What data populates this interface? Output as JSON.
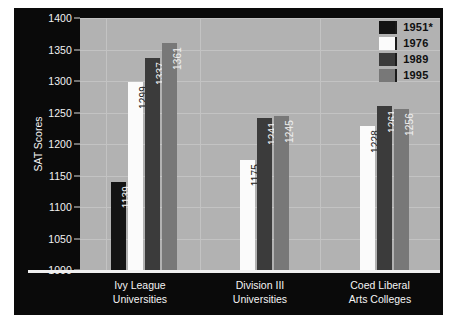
{
  "chart_data": {
    "type": "bar",
    "title": "",
    "xlabel": "",
    "ylabel": "SAT Scores",
    "ylim": [
      1000,
      1400
    ],
    "ytick_step": 50,
    "yticks": [
      1000,
      1050,
      1100,
      1150,
      1200,
      1250,
      1300,
      1350,
      1400
    ],
    "grid": true,
    "legend_position": "top-right",
    "categories": [
      "Ivy League Universities",
      "Division III Universities",
      "Coed Liberal Arts Colleges"
    ],
    "category_lines": [
      [
        "Ivy League",
        "Universities"
      ],
      [
        "Division III",
        "Universities"
      ],
      [
        "Coed Liberal",
        "Arts Colleges"
      ]
    ],
    "series": [
      {
        "name": "1951*",
        "color": "#141414",
        "label_color": "#f5f5f5",
        "values": [
          1139,
          null,
          null
        ]
      },
      {
        "name": "1976",
        "color": "#fbfbfb",
        "label_color": "#1a1a1a",
        "values": [
          1299,
          1175,
          1228
        ]
      },
      {
        "name": "1989",
        "color": "#3b3b3b",
        "label_color": "#f5f5f5",
        "values": [
          1337,
          1241,
          1261
        ]
      },
      {
        "name": "1995",
        "color": "#787878",
        "label_color": "#f0f0f0",
        "values": [
          1361,
          1245,
          1256
        ]
      }
    ]
  },
  "legend": {
    "entries": [
      {
        "label": "1951*",
        "color": "#141414"
      },
      {
        "label": "1976",
        "color": "#fbfbfb"
      },
      {
        "label": "1989",
        "color": "#3b3b3b"
      },
      {
        "label": "1995",
        "color": "#787878"
      }
    ]
  },
  "axis": {
    "y_title": "SAT Scores",
    "y_labels": [
      "1400",
      "1350",
      "1300",
      "1250",
      "1200",
      "1150",
      "1100",
      "1050",
      "1000"
    ]
  },
  "colors": {
    "frame_background": "#0a0a0a",
    "plot_background": "#b2b2b2",
    "gridline": "#c3c3c3",
    "axis_text": "#f2f2f2",
    "page_background": "#ffffff"
  }
}
